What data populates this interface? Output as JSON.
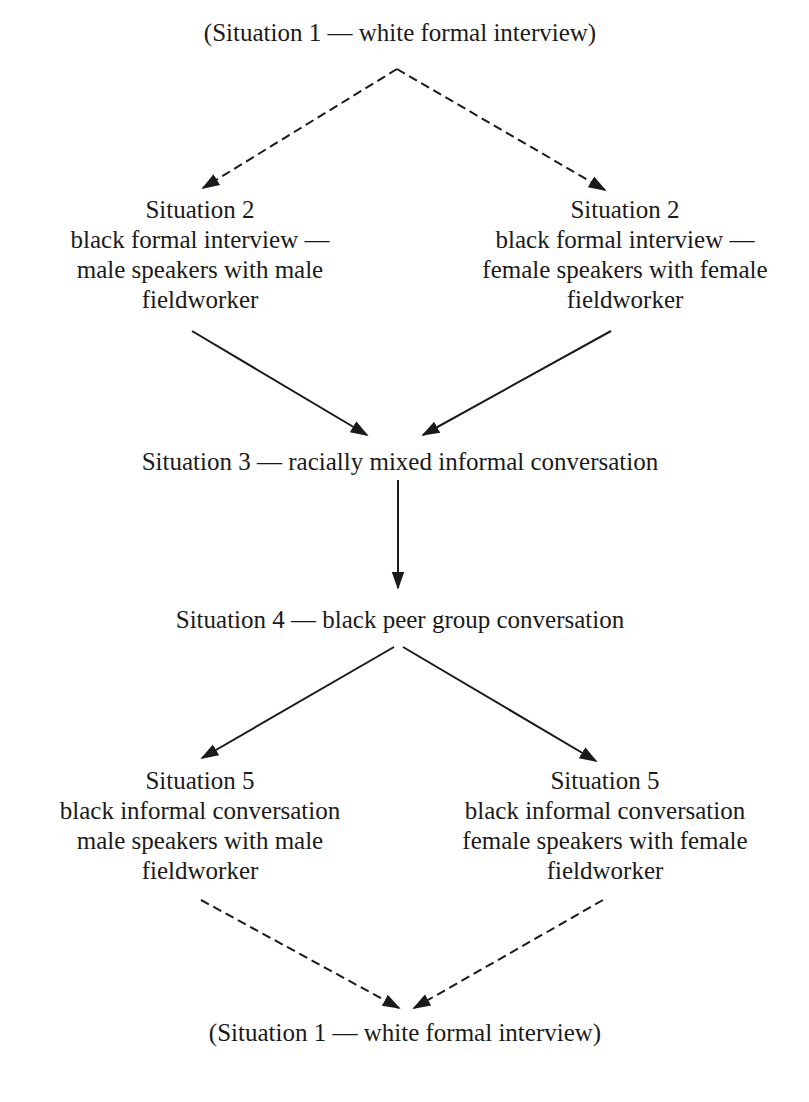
{
  "diagram": {
    "nodes": [
      {
        "id": "s1_top",
        "lines": [
          "(Situation 1 — white formal interview)"
        ]
      },
      {
        "id": "s2_left",
        "lines": [
          "Situation 2",
          "black formal interview —",
          "male speakers with male",
          "fieldworker"
        ]
      },
      {
        "id": "s2_right",
        "lines": [
          "Situation 2",
          "black formal interview —",
          "female speakers with female",
          "fieldworker"
        ]
      },
      {
        "id": "s3",
        "lines": [
          "Situation 3 — racially mixed informal conversation"
        ]
      },
      {
        "id": "s4",
        "lines": [
          "Situation 4 — black peer group conversation"
        ]
      },
      {
        "id": "s5_left",
        "lines": [
          "Situation 5",
          "black informal conversation",
          "male speakers with male",
          "fieldworker"
        ]
      },
      {
        "id": "s5_right",
        "lines": [
          "Situation 5",
          "black informal conversation",
          "female speakers with female",
          "fieldworker"
        ]
      },
      {
        "id": "s1_bottom",
        "lines": [
          "(Situation 1 — white formal interview)"
        ]
      }
    ],
    "edges": [
      {
        "from": "s1_top",
        "to": "s2_left",
        "style": "dashed"
      },
      {
        "from": "s1_top",
        "to": "s2_right",
        "style": "dashed"
      },
      {
        "from": "s2_left",
        "to": "s3",
        "style": "solid"
      },
      {
        "from": "s2_right",
        "to": "s3",
        "style": "solid"
      },
      {
        "from": "s3",
        "to": "s4",
        "style": "solid"
      },
      {
        "from": "s4",
        "to": "s5_left",
        "style": "solid"
      },
      {
        "from": "s4",
        "to": "s5_right",
        "style": "solid"
      },
      {
        "from": "s5_left",
        "to": "s1_bottom",
        "style": "dashed"
      },
      {
        "from": "s5_right",
        "to": "s1_bottom",
        "style": "dashed"
      }
    ],
    "colors": {
      "ink": "#1a1a1a",
      "background": "#ffffff"
    }
  }
}
